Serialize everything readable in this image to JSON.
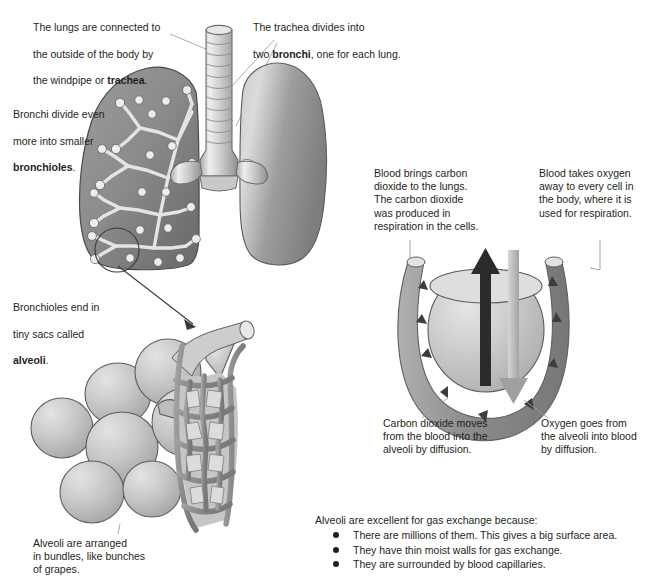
{
  "diagram": {
    "colors": {
      "ink": "#231f20",
      "leader_line": "#9a9a9a",
      "lung_fill_dark": "#8e8e8e",
      "lung_fill_light": "#d9d9d9",
      "tissue_outline": "#4d4d4d",
      "co2_arrow": "#2b2b2b",
      "o2_arrow": "#b3b3b3",
      "capillary": "#8a8a8a",
      "alveolus_fill": "#cfcfcf"
    }
  },
  "captions": {
    "trachea": {
      "line1": "The lungs are connected to",
      "line2": "the outside of the body by",
      "line3_pre": "the windpipe or ",
      "line3_bold": "trachea",
      "line3_post": "."
    },
    "bronchi": {
      "line1": "The trachea divides into",
      "line2_pre": "two ",
      "line2_bold": "bronchi",
      "line2_post": ", one for each lung."
    },
    "bronchioles": {
      "line1": "Bronchi divide even",
      "line2": "more into smaller",
      "line3_bold": "bronchioles",
      "line3_post": "."
    },
    "alveoli_sacs": {
      "line1": "Bronchioles end in",
      "line2": "tiny sacs called",
      "line3_bold": "alveoli",
      "line3_post": "."
    },
    "blood_co2": "Blood brings carbon\ndioxide to the lungs.\nThe carbon dioxide\nwas produced in\nrespiration in the cells.",
    "blood_o2": "Blood takes oxygen\naway to every cell in\nthe body, where it is\nused for respiration.",
    "co2_diffusion": "Carbon dioxide moves\nfrom the blood into the\nalveoli by diffusion.",
    "o2_diffusion": "Oxygen goes from\nthe alveoli into blood\nby diffusion.",
    "grapes": "Alveoli are arranged\nin bundles, like bunches\nof grapes."
  },
  "gas_exchange_list": {
    "lead": "Alveoli are excellent for gas exchange because:",
    "items": [
      "There are millions of them. This gives a big surface area.",
      "They have thin moist walls for gas exchange.",
      "They are surrounded by blood capillaries."
    ]
  },
  "labels": {
    "trachea_icon": "trachea-tube",
    "left_lung_icon": "left-lung-bronchial-tree",
    "right_lung_icon": "right-lung-solid",
    "alveoli_cluster_icon": "alveoli-grape-cluster",
    "capillary_mesh_icon": "capillary-network",
    "gas_exchange_icon": "alveolus-capillary-loop",
    "co2_arrow_icon": "carbon-dioxide-up-arrow",
    "o2_arrow_icon": "oxygen-down-arrow"
  }
}
